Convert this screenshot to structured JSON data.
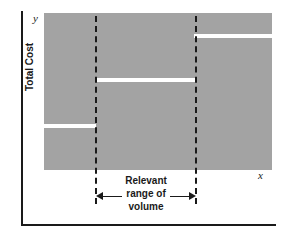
{
  "figure": {
    "name": "step-cost-behavior-graph",
    "plot_bg_color": "#a3a3a3",
    "line_color": "#ffffff",
    "axis_color": "#1a1a1a"
  },
  "axes": {
    "y_letter": "y",
    "x_letter": "x",
    "y_title": "Total Cost",
    "x_title": ""
  },
  "annotation": {
    "line1": "Relevant",
    "line2": "range of",
    "line3": "volume"
  },
  "chart_data": {
    "type": "line",
    "title": "",
    "subtitle": "",
    "xlabel": "x",
    "ylabel": "Total Cost",
    "xlim": [
      0,
      100
    ],
    "ylim": [
      0,
      100
    ],
    "grid": false,
    "legend": null,
    "series": [
      {
        "name": "Total Cost (step function)",
        "style": "step",
        "color": "#ffffff",
        "steps": [
          {
            "label": "below relevant range",
            "x_start": 0,
            "x_end": 22,
            "y": 29
          },
          {
            "label": "relevant range",
            "x_start": 22,
            "x_end": 67,
            "y": 59
          },
          {
            "label": "above relevant range",
            "x_start": 67,
            "x_end": 100,
            "y": 87
          }
        ]
      }
    ],
    "annotations": [
      {
        "type": "vertical-dashed-line",
        "name": "relevant-range-lower-bound",
        "x": 22
      },
      {
        "type": "vertical-dashed-line",
        "name": "relevant-range-upper-bound",
        "x": 67
      },
      {
        "type": "double-arrow-span",
        "name": "relevant-range-span",
        "x_start": 22,
        "x_end": 67,
        "text": "Relevant range of volume"
      }
    ]
  },
  "geometry": {
    "steps": [
      {
        "left": 0,
        "width": 52,
        "top": 111
      },
      {
        "left": 51,
        "width": 101,
        "top": 65
      },
      {
        "left": 150,
        "width": 78,
        "top": 21
      }
    ],
    "dividers": [
      {
        "left": 51,
        "top": 16,
        "height": 188
      },
      {
        "left": 151,
        "top": 16,
        "height": 188
      }
    ]
  }
}
